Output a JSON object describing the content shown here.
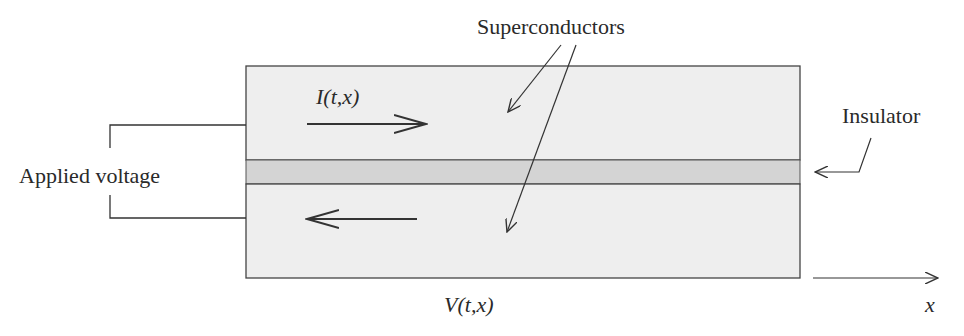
{
  "diagram": {
    "type": "josephson-junction-schematic",
    "labels": {
      "superconductors": "Superconductors",
      "insulator": "Insulator",
      "applied_voltage": "Applied voltage",
      "current": "I(t,x)",
      "voltage": "V(t,x)",
      "x_axis": "x"
    },
    "colors": {
      "superconductor_fill": "#eeeeee",
      "insulator_fill": "#d4d4d4",
      "stroke": "#333333",
      "background": "#ffffff"
    },
    "components": [
      {
        "name": "top-superconductor",
        "role": "superconductor"
      },
      {
        "name": "insulator-layer",
        "role": "insulator"
      },
      {
        "name": "bottom-superconductor",
        "role": "superconductor"
      }
    ],
    "arrows": [
      {
        "name": "current-forward",
        "direction": "right",
        "layer": "top-superconductor"
      },
      {
        "name": "current-return",
        "direction": "left",
        "layer": "bottom-superconductor"
      },
      {
        "name": "x-axis",
        "direction": "right"
      }
    ]
  }
}
